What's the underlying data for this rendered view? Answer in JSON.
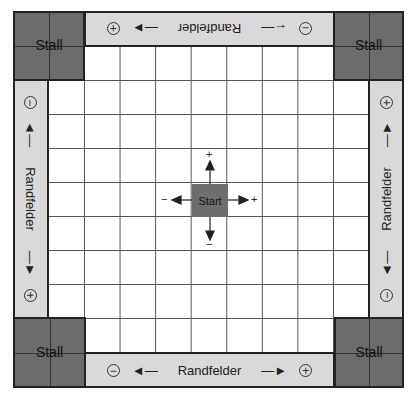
{
  "board": {
    "grid": {
      "columns": 7,
      "rows": 7
    },
    "colors": {
      "stall": "#6b6b6b",
      "edge_band": "#d9d9d9",
      "start": "#6e6e6e",
      "grid_line": "#555555"
    },
    "stalls": {
      "top_left": "Stall",
      "top_right": "Stall",
      "bottom_left": "Stall",
      "bottom_right": "Stall"
    },
    "edges": {
      "top": {
        "label": "Randfelder",
        "left_sign": "+",
        "right_sign": "−",
        "orientation": "upside-down"
      },
      "bottom": {
        "label": "Randfelder",
        "left_sign": "−",
        "right_sign": "+"
      },
      "left": {
        "label": "Randfelder",
        "top_sign": "−",
        "bottom_sign": "+",
        "orientation": "rotated 90° clockwise"
      },
      "right": {
        "label": "Randfelder",
        "top_sign": "+",
        "bottom_sign": "−",
        "orientation": "rotated 90° counter-clockwise"
      }
    },
    "start": {
      "label": "Start",
      "up_sign": "+",
      "down_sign": "−",
      "left_sign": "−",
      "right_sign": "+"
    }
  }
}
